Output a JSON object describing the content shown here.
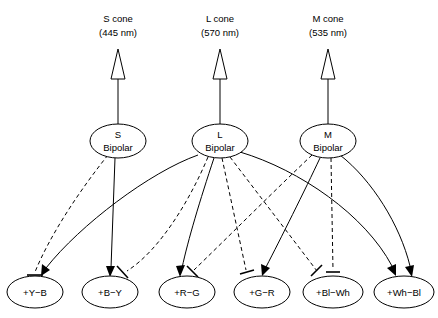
{
  "figure": {
    "background_color": "#ffffff",
    "line_color": "#000000"
  },
  "cones": [
    {
      "id": "s-cone",
      "name": "S cone",
      "wavelength": "(445 nm)",
      "x": 118
    },
    {
      "id": "l-cone",
      "name": "L cone",
      "wavelength": "(570 nm)",
      "x": 220
    },
    {
      "id": "m-cone",
      "name": "M cone",
      "wavelength": "(535 nm)",
      "x": 328
    }
  ],
  "bipolars": [
    {
      "id": "s-bipolar",
      "line1": "S",
      "line2": "Bipolar",
      "x": 118,
      "y": 141
    },
    {
      "id": "l-bipolar",
      "line1": "L",
      "line2": "Bipolar",
      "x": 220,
      "y": 141
    },
    {
      "id": "m-bipolar",
      "line1": "M",
      "line2": "Bipolar",
      "x": 328,
      "y": 141
    }
  ],
  "opponent_cells": [
    {
      "id": "cell-y-b",
      "label": "+Y−B",
      "x": 35,
      "y": 292
    },
    {
      "id": "cell-b-y",
      "label": "+B−Y",
      "x": 110,
      "y": 292
    },
    {
      "id": "cell-r-g",
      "label": "+R−G",
      "x": 187,
      "y": 292
    },
    {
      "id": "cell-g-r",
      "label": "+G−R",
      "x": 262,
      "y": 292
    },
    {
      "id": "cell-bl-wh",
      "label": "+Bl−Wh",
      "x": 333,
      "y": 292
    },
    {
      "id": "cell-wh-bl",
      "label": "+Wh−Bl",
      "x": 404,
      "y": 292
    }
  ],
  "connections": [
    {
      "id": "conn-s-to-yb",
      "from": "s-bipolar",
      "to": "cell-y-b",
      "type": "inhibitory",
      "style": "dashed",
      "terminal": "t-bar"
    },
    {
      "id": "conn-s-to-by",
      "from": "s-bipolar",
      "to": "cell-b-y",
      "type": "excitatory",
      "style": "solid",
      "terminal": "arrow"
    },
    {
      "id": "conn-l-to-yb",
      "from": "l-bipolar",
      "to": "cell-y-b",
      "type": "excitatory",
      "style": "solid",
      "terminal": "arrow"
    },
    {
      "id": "conn-l-to-by",
      "from": "l-bipolar",
      "to": "cell-b-y",
      "type": "inhibitory",
      "style": "dashed",
      "terminal": "t-bar"
    },
    {
      "id": "conn-l-to-rg",
      "from": "l-bipolar",
      "to": "cell-r-g",
      "type": "excitatory",
      "style": "solid",
      "terminal": "arrow"
    },
    {
      "id": "conn-l-to-gr",
      "from": "l-bipolar",
      "to": "cell-g-r",
      "type": "inhibitory",
      "style": "dashed",
      "terminal": "t-bar"
    },
    {
      "id": "conn-l-to-blwh",
      "from": "l-bipolar",
      "to": "cell-bl-wh",
      "type": "inhibitory",
      "style": "dashed",
      "terminal": "t-bar"
    },
    {
      "id": "conn-l-to-whbl",
      "from": "l-bipolar",
      "to": "cell-wh-bl",
      "type": "excitatory",
      "style": "solid",
      "terminal": "arrow"
    },
    {
      "id": "conn-m-to-rg",
      "from": "m-bipolar",
      "to": "cell-r-g",
      "type": "inhibitory",
      "style": "dashed",
      "terminal": "t-bar"
    },
    {
      "id": "conn-m-to-gr",
      "from": "m-bipolar",
      "to": "cell-g-r",
      "type": "excitatory",
      "style": "solid",
      "terminal": "arrow"
    },
    {
      "id": "conn-m-to-blwh",
      "from": "m-bipolar",
      "to": "cell-bl-wh",
      "type": "inhibitory",
      "style": "dashed",
      "terminal": "t-bar"
    },
    {
      "id": "conn-m-to-whbl",
      "from": "m-bipolar",
      "to": "cell-wh-bl",
      "type": "excitatory",
      "style": "solid",
      "terminal": "arrow"
    }
  ]
}
